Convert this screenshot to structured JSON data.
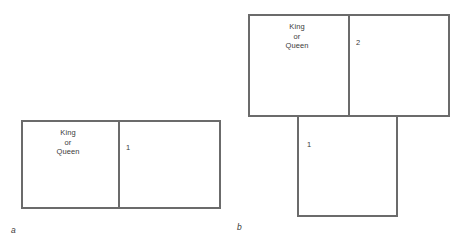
{
  "figure": {
    "background_color": "#ffffff",
    "line_color": "#6b6b6b",
    "text_color": "#3a3a3a"
  },
  "panel_a": {
    "letter": "a",
    "cells": [
      {
        "id": "royal",
        "text": "King\nor\nQueen"
      },
      {
        "id": "seat-1",
        "text": "1"
      }
    ]
  },
  "panel_b": {
    "letter": "b",
    "top_cells": [
      {
        "id": "royal",
        "text": "King\nor\nQueen"
      },
      {
        "id": "seat-2",
        "text": "2"
      }
    ],
    "bottom_cells": [
      {
        "id": "seat-1",
        "text": "1"
      }
    ]
  }
}
